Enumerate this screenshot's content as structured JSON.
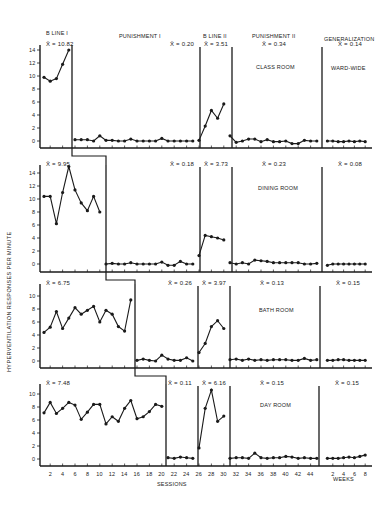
{
  "chart_data": {
    "type": "line",
    "title": "",
    "ylabel": "HYPERVENTILATION RESPONSES PER MINUTE",
    "xlabel": "SESSIONS",
    "xlabel_secondary": "WEEKS",
    "grid": false,
    "legend": null,
    "phases": [
      "B LINE I",
      "PUNISHMENT I",
      "B LINE II",
      "PUNISHMENT II",
      "GENERALIZATION"
    ],
    "x_ticks_sessions": [
      "2",
      "4",
      "6",
      "8",
      "10",
      "12",
      "14",
      "16",
      "18",
      "20",
      "22",
      "24",
      "26",
      "28",
      "30",
      "32",
      "34",
      "36",
      "38",
      "40",
      "42",
      "44"
    ],
    "x_ticks_weeks": [
      "2",
      "4",
      "6",
      "8"
    ],
    "panels": [
      {
        "setting": "CLASS ROOM",
        "generalization_setting": "WARD-WIDE",
        "ylim": [
          0,
          14
        ],
        "y_ticks": [
          "0",
          "2",
          "4",
          "6",
          "8",
          "10",
          "12",
          "14"
        ],
        "phase_means": [
          "X̄ = 10.82",
          "X̄ = 0.20",
          "X̄ = 3.51",
          "X̄ = 0.34",
          "X̄ = 0.14"
        ],
        "series": [
          {
            "phase": "B LINE I",
            "x": [
              1,
              2,
              3,
              4,
              5
            ],
            "values": [
              9.8,
              9.2,
              9.6,
              11.8,
              14.0
            ]
          },
          {
            "phase": "PUNISHMENT I",
            "x": [
              6,
              7,
              8,
              9,
              10,
              11,
              12,
              13,
              14,
              15,
              16,
              17,
              18,
              19,
              20,
              21,
              22,
              23,
              24,
              25
            ],
            "values": [
              0.2,
              0.2,
              0.2,
              0,
              0.8,
              0.1,
              0.1,
              0,
              0,
              0.3,
              0,
              0,
              0,
              0,
              0.4,
              0,
              0,
              0,
              0,
              0
            ]
          },
          {
            "phase": "B LINE II",
            "x": [
              26,
              27,
              28,
              29,
              30
            ],
            "values": [
              0.1,
              2.3,
              4.7,
              3.5,
              5.7
            ]
          },
          {
            "phase": "PUNISHMENT II",
            "x": [
              31,
              32,
              33,
              34,
              35,
              36,
              37,
              38,
              39,
              40,
              41,
              42,
              43,
              44,
              45
            ],
            "values": [
              0.8,
              -0.2,
              0,
              0.3,
              0.3,
              -0.1,
              0.2,
              -0.1,
              -0.1,
              0,
              -0.4,
              -0.4,
              0.1,
              0,
              0
            ]
          },
          {
            "phase": "GENERALIZATION",
            "x_weeks": [
              1,
              2,
              3,
              4,
              5,
              6,
              7,
              8
            ],
            "values": [
              0,
              0,
              -0.1,
              -0.1,
              0,
              -0.1,
              0,
              -0.1
            ]
          }
        ]
      },
      {
        "setting": "DINING ROOM",
        "ylim": [
          0,
          14
        ],
        "y_ticks": [
          "0",
          "2",
          "4",
          "6",
          "8",
          "10",
          "12",
          "14"
        ],
        "phase_means": [
          "X̄ = 9.95",
          "X̄ = 0.18",
          "X̄ = 3.73",
          "X̄ = 0.23",
          "X̄ = 0.08"
        ],
        "series": [
          {
            "phase": "B LINE I",
            "x": [
              1,
              2,
              3,
              4,
              5,
              6,
              7,
              8,
              9,
              10
            ],
            "values": [
              10.4,
              10.4,
              6.2,
              11.0,
              15.0,
              11.4,
              9.4,
              8.2,
              10.4,
              8.0
            ]
          },
          {
            "phase": "PUNISHMENT I",
            "x": [
              11,
              12,
              13,
              14,
              15,
              16,
              17,
              18,
              19,
              20,
              21,
              22,
              23,
              24,
              25
            ],
            "values": [
              0,
              0.1,
              0,
              0,
              0.2,
              0,
              0,
              0,
              0,
              0.3,
              -0.2,
              -0.2,
              0.4,
              0,
              0
            ]
          },
          {
            "phase": "B LINE II",
            "x": [
              26,
              27,
              28,
              29,
              30
            ],
            "values": [
              1.3,
              4.4,
              4.2,
              4.0,
              3.7
            ]
          },
          {
            "phase": "PUNISHMENT II",
            "x": [
              31,
              32,
              33,
              34,
              35,
              36,
              37,
              38,
              39,
              40,
              41,
              42,
              43,
              44,
              45
            ],
            "values": [
              0.2,
              0,
              0.2,
              0,
              0.6,
              0.5,
              0.4,
              0.2,
              0.2,
              0.2,
              0.2,
              0.2,
              0,
              0,
              0.1
            ]
          },
          {
            "phase": "GENERALIZATION",
            "x_weeks": [
              1,
              2,
              3,
              4,
              5,
              6,
              7,
              8
            ],
            "values": [
              -0.2,
              0,
              0,
              0,
              0,
              0,
              0,
              0
            ]
          }
        ]
      },
      {
        "setting": "BATH ROOM",
        "ylim": [
          0,
          10
        ],
        "y_ticks": [
          "0",
          "2",
          "4",
          "6",
          "8",
          "10"
        ],
        "phase_means": [
          "X̄ = 6.75",
          "X̄ = 0.26",
          "X̄ = 3.97",
          "X̄ = 0.13",
          "X̄ = 0.15"
        ],
        "series": [
          {
            "phase": "B LINE I",
            "x": [
              1,
              2,
              3,
              4,
              5,
              6,
              7,
              8,
              9,
              10,
              11,
              12,
              13,
              14,
              15
            ],
            "values": [
              4.4,
              5.2,
              7.6,
              5.0,
              6.6,
              8.2,
              7.2,
              7.8,
              8.4,
              6.0,
              7.8,
              7.2,
              5.3,
              4.6,
              9.4
            ]
          },
          {
            "phase": "PUNISHMENT I",
            "x": [
              16,
              17,
              18,
              19,
              20,
              21,
              22,
              23,
              24,
              25
            ],
            "values": [
              0.1,
              0.3,
              0.1,
              0,
              0.9,
              0.3,
              0.1,
              0.1,
              0.5,
              0
            ]
          },
          {
            "phase": "B LINE II",
            "x": [
              26,
              27,
              28,
              29,
              30
            ],
            "values": [
              1.3,
              2.7,
              5.3,
              6.2,
              5.0
            ]
          },
          {
            "phase": "PUNISHMENT II",
            "x": [
              31,
              32,
              33,
              34,
              35,
              36,
              37,
              38,
              39,
              40,
              41,
              42,
              43,
              44,
              45
            ],
            "values": [
              0.2,
              0.3,
              0.1,
              0.3,
              0.1,
              0.2,
              0.1,
              0.2,
              0.2,
              0.2,
              0.1,
              0.1,
              0.4,
              0.1,
              0.2
            ]
          },
          {
            "phase": "GENERALIZATION",
            "x_weeks": [
              1,
              2,
              3,
              4,
              5,
              6,
              7,
              8
            ],
            "values": [
              0.1,
              0.1,
              0.2,
              0.2,
              0.1,
              0.1,
              0.1,
              0.1
            ]
          }
        ]
      },
      {
        "setting": "DAY ROOM",
        "ylim": [
          0,
          10
        ],
        "y_ticks": [
          "0",
          "2",
          "4",
          "6",
          "8",
          "10"
        ],
        "phase_means": [
          "X̄ = 7.48",
          "X̄ = 0.11",
          "X̄ = 6.16",
          "X̄ = 0.15",
          "X̄ = 0.15"
        ],
        "series": [
          {
            "phase": "B LINE I",
            "x": [
              1,
              2,
              3,
              4,
              5,
              6,
              7,
              8,
              9,
              10,
              11,
              12,
              13,
              14,
              15,
              16,
              17,
              18,
              19,
              20
            ],
            "values": [
              7.1,
              8.7,
              7.0,
              7.8,
              8.7,
              8.3,
              6.1,
              7.2,
              8.4,
              8.4,
              5.4,
              6.5,
              5.8,
              7.8,
              9.0,
              6.2,
              6.5,
              7.3,
              8.4,
              8.1
            ]
          },
          {
            "phase": "PUNISHMENT I",
            "x": [
              21,
              22,
              23,
              24,
              25
            ],
            "values": [
              0.2,
              0.1,
              0.3,
              0.2,
              0.1
            ]
          },
          {
            "phase": "B LINE II",
            "x": [
              26,
              27,
              28,
              29,
              30
            ],
            "values": [
              1.7,
              7.8,
              10.6,
              5.8,
              6.6
            ]
          },
          {
            "phase": "PUNISHMENT II",
            "x": [
              31,
              32,
              33,
              34,
              35,
              36,
              37,
              38,
              39,
              40,
              41,
              42,
              43,
              44,
              45
            ],
            "values": [
              0.1,
              0.2,
              0.2,
              0.1,
              0.9,
              0.2,
              0.1,
              0.2,
              0.2,
              0.4,
              0.3,
              0.1,
              0.2,
              0.1,
              0.1
            ]
          },
          {
            "phase": "GENERALIZATION",
            "x_weeks": [
              1,
              2,
              3,
              4,
              5,
              6,
              7,
              8
            ],
            "values": [
              0.1,
              0.1,
              0.1,
              0.2,
              0.3,
              0.2,
              0.4,
              0.6
            ]
          }
        ]
      }
    ]
  },
  "labels": {
    "phase_1": "B LINE I",
    "phase_2": "PUNISHMENT I",
    "phase_3": "B LINE II",
    "phase_4": "PUNISHMENT II",
    "phase_5": "GENERALIZATION",
    "ylabel": "HYPERVENTILATION RESPONSES PER MINUTE",
    "xlabel": "SESSIONS",
    "xlabel_weeks": "WEEKS",
    "panel_1_setting": "CLASS ROOM",
    "panel_1_gen_setting": "WARD-WIDE",
    "panel_2_setting": "DINING ROOM",
    "panel_3_setting": "BATH ROOM",
    "panel_4_setting": "DAY ROOM"
  }
}
